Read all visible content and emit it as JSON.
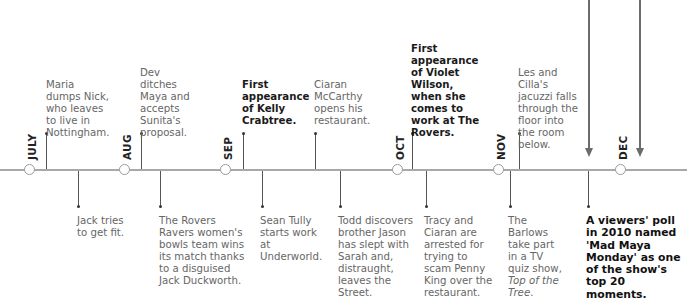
{
  "timeline": {
    "months": [
      {
        "label": "JULY",
        "x": 30
      },
      {
        "label": "AUG",
        "x": 125
      },
      {
        "label": "SEP",
        "x": 226
      },
      {
        "label": "OCT",
        "x": 398
      },
      {
        "label": "NOV",
        "x": 499
      },
      {
        "label": "DEC",
        "x": 621
      }
    ],
    "events_above": [
      {
        "text": "Maria dumps Nick, who leaves to live in Nottingham.",
        "bold": false
      },
      {
        "text": "Dev ditches Maya and accepts Sunita's proposal.",
        "bold": false
      },
      {
        "text": "First appearance of Kelly Crabtree.",
        "bold": true
      },
      {
        "text": "Ciaran McCarthy opens his restaurant.",
        "bold": false
      },
      {
        "text": "First appearance of Violet Wilson, when she comes to work at The Rovers.",
        "bold": true
      },
      {
        "text": "Les and Cilla's jacuzzi falls through the floor into the room below.",
        "bold": false
      }
    ],
    "events_below": [
      {
        "text": "Jack tries to get fit.",
        "bold": false
      },
      {
        "text": "The Rovers Ravers women's bowls team wins its match thanks to a disguised Jack Duckworth.",
        "bold": false
      },
      {
        "text": "Sean Tully starts work at Underworld.",
        "bold": false
      },
      {
        "text": "Todd discovers brother Jason has slept with Sarah and, distraught, leaves the Street.",
        "bold": false
      },
      {
        "text": "Tracy and Ciaran are arrested for trying to scam Penny King over the restaurant.",
        "bold": false
      },
      {
        "text_prefix": "The Barlows take part in a TV quiz show, ",
        "text_italic": "Top of the Tree",
        "text_suffix": ".",
        "bold": false
      },
      {
        "text": "A viewers' poll in 2010 named 'Mad Maya Monday' as one of the show's top 20 moments.",
        "bold": true
      }
    ]
  },
  "colors": {
    "axis": "#a9a9a9",
    "tick": "#555555",
    "arrow": "#6b6b6b",
    "text_regular": "#666666",
    "text_bold": "#1a1a1a"
  }
}
